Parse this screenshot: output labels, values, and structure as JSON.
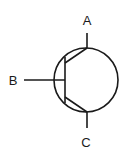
{
  "diagram": {
    "type": "transistor-symbol",
    "labels": {
      "top": "A",
      "left": "B",
      "bottom": "C"
    },
    "colors": {
      "stroke": "#1a1a1a",
      "background": "#ffffff"
    }
  }
}
